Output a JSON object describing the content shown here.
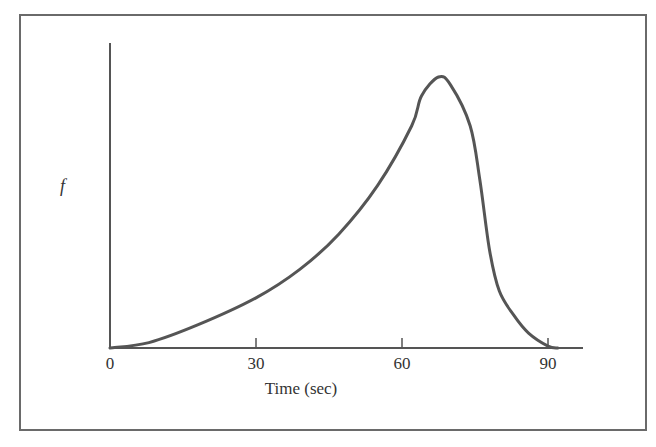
{
  "chart_data": {
    "type": "line",
    "title": "",
    "xlabel": "Time (sec)",
    "ylabel": "f",
    "x_ticks": [
      0,
      30,
      60,
      90
    ],
    "xlim": [
      0,
      97
    ],
    "ylim": [
      0,
      1
    ],
    "grid": false,
    "legend": null,
    "series": [
      {
        "name": "f",
        "x": [
          0,
          8,
          18,
          30,
          39,
          47,
          55,
          62,
          64,
          67.5,
          70,
          74,
          76,
          78,
          80,
          83,
          86,
          90,
          92
        ],
        "y": [
          0,
          0.02,
          0.085,
          0.185,
          0.29,
          0.42,
          0.6,
          0.82,
          0.93,
          1.0,
          0.97,
          0.82,
          0.62,
          0.36,
          0.21,
          0.12,
          0.055,
          0.007,
          0
        ]
      }
    ],
    "color": "#555555"
  },
  "labels": {
    "y_axis": "f",
    "x_axis": "Time (sec)",
    "ticks": [
      "0",
      "30",
      "60",
      "90"
    ]
  }
}
